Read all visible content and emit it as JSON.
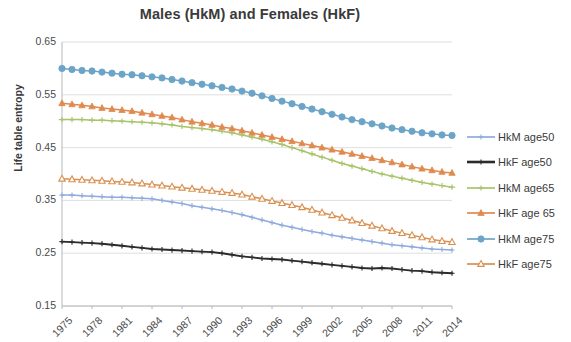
{
  "chart_data": {
    "type": "line",
    "title": "Males (HkM) and Females (HkF)",
    "xlabel": "",
    "ylabel": "Life table entropy",
    "ylim": [
      0.15,
      0.65
    ],
    "ytick_step": 0.1,
    "ytick_labels": [
      "0.65",
      "0.55",
      "0.45",
      "0.35",
      "0.25",
      "0.15"
    ],
    "ytick_values": [
      0.65,
      0.55,
      0.45,
      0.35,
      0.25,
      0.15
    ],
    "grid": true,
    "legend_position": "right",
    "x": [
      1975,
      1976,
      1977,
      1978,
      1979,
      1980,
      1981,
      1982,
      1983,
      1984,
      1985,
      1986,
      1987,
      1988,
      1989,
      1990,
      1991,
      1992,
      1993,
      1994,
      1995,
      1996,
      1997,
      1998,
      1999,
      2000,
      2001,
      2002,
      2003,
      2004,
      2005,
      2006,
      2007,
      2008,
      2009,
      2010,
      2011,
      2012,
      2013,
      2014
    ],
    "xtick_labels": [
      "1975",
      "1978",
      "1981",
      "1984",
      "1987",
      "1990",
      "1993",
      "1996",
      "1999",
      "2002",
      "2005",
      "2008",
      "2011",
      "2014"
    ],
    "xtick_values": [
      1975,
      1978,
      1981,
      1984,
      1987,
      1990,
      1993,
      1996,
      1999,
      2002,
      2005,
      2008,
      2011,
      2014
    ],
    "series": [
      {
        "name": "HkM age50",
        "color": "#8faadc",
        "marker": "plus",
        "values": [
          0.36,
          0.36,
          0.359,
          0.358,
          0.357,
          0.356,
          0.356,
          0.355,
          0.354,
          0.353,
          0.35,
          0.347,
          0.344,
          0.34,
          0.337,
          0.334,
          0.331,
          0.327,
          0.323,
          0.318,
          0.313,
          0.308,
          0.303,
          0.299,
          0.295,
          0.291,
          0.288,
          0.284,
          0.281,
          0.278,
          0.275,
          0.272,
          0.269,
          0.266,
          0.264,
          0.262,
          0.26,
          0.258,
          0.257,
          0.256
        ]
      },
      {
        "name": "HkF age50",
        "color": "#2b2b2b",
        "marker": "plus",
        "values": [
          0.272,
          0.271,
          0.27,
          0.269,
          0.268,
          0.266,
          0.264,
          0.262,
          0.26,
          0.258,
          0.257,
          0.256,
          0.255,
          0.254,
          0.253,
          0.252,
          0.25,
          0.247,
          0.244,
          0.242,
          0.24,
          0.239,
          0.238,
          0.236,
          0.234,
          0.232,
          0.23,
          0.228,
          0.226,
          0.224,
          0.222,
          0.221,
          0.222,
          0.221,
          0.219,
          0.217,
          0.216,
          0.214,
          0.213,
          0.212
        ]
      },
      {
        "name": "HkM age65",
        "color": "#a8c46a",
        "marker": "dash",
        "values": [
          0.503,
          0.503,
          0.503,
          0.502,
          0.502,
          0.501,
          0.5,
          0.499,
          0.498,
          0.497,
          0.495,
          0.493,
          0.49,
          0.488,
          0.486,
          0.484,
          0.481,
          0.478,
          0.474,
          0.47,
          0.466,
          0.461,
          0.456,
          0.45,
          0.444,
          0.438,
          0.432,
          0.426,
          0.42,
          0.415,
          0.41,
          0.405,
          0.4,
          0.396,
          0.392,
          0.388,
          0.384,
          0.381,
          0.378,
          0.375
        ]
      },
      {
        "name": "HkF age65",
        "color": "#e08a4f",
        "marker": "triangle",
        "values": [
          0.534,
          0.532,
          0.53,
          0.528,
          0.525,
          0.523,
          0.521,
          0.519,
          0.516,
          0.513,
          0.51,
          0.507,
          0.503,
          0.499,
          0.496,
          0.493,
          0.489,
          0.486,
          0.482,
          0.478,
          0.474,
          0.47,
          0.466,
          0.462,
          0.458,
          0.454,
          0.45,
          0.446,
          0.442,
          0.438,
          0.434,
          0.43,
          0.426,
          0.422,
          0.418,
          0.414,
          0.41,
          0.407,
          0.404,
          0.402
        ]
      },
      {
        "name": "HkM age75",
        "color": "#6ca4c8",
        "marker": "circle",
        "values": [
          0.6,
          0.598,
          0.596,
          0.595,
          0.593,
          0.591,
          0.589,
          0.588,
          0.586,
          0.584,
          0.582,
          0.579,
          0.576,
          0.573,
          0.57,
          0.567,
          0.564,
          0.561,
          0.557,
          0.553,
          0.548,
          0.543,
          0.538,
          0.533,
          0.528,
          0.523,
          0.518,
          0.513,
          0.508,
          0.503,
          0.499,
          0.495,
          0.491,
          0.487,
          0.484,
          0.481,
          0.478,
          0.476,
          0.474,
          0.473
        ]
      },
      {
        "name": "HkF age75",
        "color": "#d99152",
        "marker": "triangle-open",
        "values": [
          0.391,
          0.39,
          0.389,
          0.388,
          0.387,
          0.386,
          0.385,
          0.384,
          0.382,
          0.38,
          0.378,
          0.376,
          0.374,
          0.372,
          0.37,
          0.368,
          0.366,
          0.364,
          0.361,
          0.357,
          0.353,
          0.349,
          0.345,
          0.341,
          0.337,
          0.332,
          0.327,
          0.322,
          0.317,
          0.312,
          0.307,
          0.302,
          0.297,
          0.292,
          0.288,
          0.284,
          0.28,
          0.276,
          0.273,
          0.271
        ]
      }
    ]
  },
  "legend": {
    "items": [
      {
        "label": "HkM age50"
      },
      {
        "label": "HkF age50"
      },
      {
        "label": "HkM age65"
      },
      {
        "label": "HkF age 65"
      },
      {
        "label": "HkM age75"
      },
      {
        "label": "HkF age75"
      }
    ]
  }
}
